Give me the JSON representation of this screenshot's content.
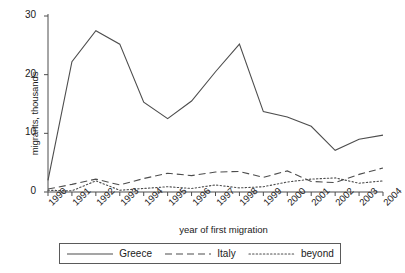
{
  "chart_data": {
    "type": "line",
    "title": "",
    "xlabel": "year of first migration",
    "ylabel": "migrants, thousands",
    "categories": [
      "1990",
      "1991",
      "1992",
      "1993",
      "1994",
      "1995",
      "1996",
      "1997",
      "1998",
      "1999",
      "2000",
      "2001",
      "2002",
      "2003",
      "2004"
    ],
    "x": [
      1990,
      1991,
      1992,
      1993,
      1994,
      1995,
      1996,
      1997,
      1998,
      1999,
      2000,
      2001,
      2002,
      2003,
      2004
    ],
    "xlim": [
      1990,
      2004
    ],
    "ylim": [
      0,
      30
    ],
    "yticks": [
      0,
      10,
      20,
      30
    ],
    "grid": false,
    "legend_position": "bottom",
    "series": [
      {
        "name": "Greece",
        "style": "solid",
        "color": "#4d4d4d",
        "values": [
          2.0,
          22.2,
          27.5,
          25.2,
          15.3,
          12.5,
          15.5,
          20.5,
          25.2,
          13.7,
          12.8,
          11.2,
          7.1,
          9.0,
          9.7
        ]
      },
      {
        "name": "Italy",
        "style": "dashed",
        "color": "#4d4d4d",
        "values": [
          0.5,
          1.3,
          2.2,
          1.2,
          2.3,
          3.2,
          2.8,
          3.4,
          3.5,
          2.5,
          3.6,
          1.8,
          1.6,
          3.0,
          4.1
        ]
      },
      {
        "name": "beyond",
        "style": "dotted",
        "color": "#4d4d4d",
        "values": [
          0.3,
          0.2,
          1.9,
          0.3,
          0.6,
          0.9,
          0.6,
          1.2,
          0.7,
          0.9,
          1.7,
          2.2,
          2.4,
          1.5,
          1.9
        ]
      }
    ]
  },
  "axes": {
    "y_tick_labels": [
      "30",
      "20",
      "10",
      "0"
    ],
    "axis_color": "#4d4d4d"
  },
  "legend": {
    "items": [
      {
        "label": "Greece",
        "style": "solid"
      },
      {
        "label": "Italy",
        "style": "dashed"
      },
      {
        "label": "beyond",
        "style": "dotted"
      }
    ]
  }
}
